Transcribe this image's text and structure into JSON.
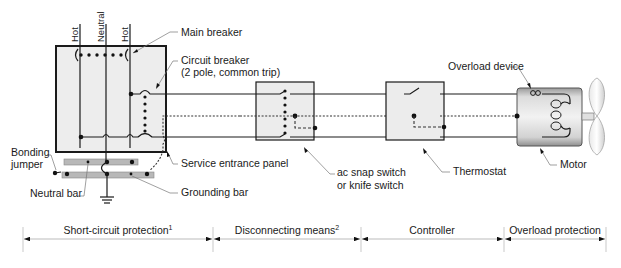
{
  "diagram": {
    "panel": {
      "conductor_labels": [
        "Hot",
        "Neutral",
        "Hot"
      ],
      "main_breaker_label": "Main breaker",
      "circuit_breaker_label_line1": "Circuit breaker",
      "circuit_breaker_label_line2": "(2 pole, common trip)",
      "service_entrance_label": "Service entrance panel",
      "bonding_jumper_line1": "Bonding",
      "bonding_jumper_line2": "jumper",
      "neutral_bar_label": "Neutral bar",
      "grounding_bar_label": "Grounding bar"
    },
    "switch": {
      "label_line1": "ac snap switch",
      "label_line2": "or knife switch"
    },
    "thermostat": {
      "label": "Thermostat"
    },
    "motor": {
      "overload_label": "Overload device",
      "label": "Motor"
    },
    "sections": [
      {
        "label": "Short-circuit protection",
        "footnote": "1"
      },
      {
        "label": "Disconnecting means",
        "footnote": "2"
      },
      {
        "label": "Controller",
        "footnote": ""
      },
      {
        "label": "Overload protection",
        "footnote": ""
      }
    ]
  }
}
